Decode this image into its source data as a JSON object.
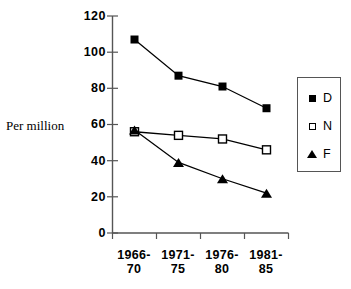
{
  "chart_data": {
    "type": "line",
    "title": "",
    "xlabel": "",
    "ylabel": "Per million",
    "ylim": [
      0,
      120
    ],
    "ytick_values": [
      0,
      20,
      40,
      60,
      80,
      100,
      120
    ],
    "ytick_labels": [
      "0",
      "20",
      "40",
      "60",
      "80",
      "100",
      "120"
    ],
    "grid": false,
    "legend_position": "right",
    "categories": [
      "1966-\n70",
      "1971-\n75",
      "1976-\n80",
      "1981-\n85"
    ],
    "category_labels_flat": [
      "1966-70",
      "1971-75",
      "1976-80",
      "1981-85"
    ],
    "series": [
      {
        "name": "D",
        "marker": "filled-square",
        "values": [
          107,
          87,
          81,
          69
        ]
      },
      {
        "name": "N",
        "marker": "open-square",
        "values": [
          56,
          54,
          52,
          46
        ]
      },
      {
        "name": "F",
        "marker": "filled-triangle",
        "values": [
          57,
          39,
          30,
          22
        ]
      }
    ]
  },
  "axis": {
    "y_title": "Per million",
    "y_ticks": [
      "120",
      "100",
      "80",
      "60",
      "40",
      "20",
      "0"
    ],
    "x_ticks": [
      "1966-\n70",
      "1971-\n75",
      "1976-\n80",
      "1981-\n85"
    ]
  },
  "legend": {
    "entries": [
      {
        "marker_icon": "filled-square-icon",
        "label": "D"
      },
      {
        "marker_icon": "open-square-icon",
        "label": "N"
      },
      {
        "marker_icon": "filled-triangle-icon",
        "label": "F"
      }
    ]
  },
  "colors": {
    "series_line": "#000000",
    "axis": "#555555",
    "background": "#ffffff",
    "legend_border": "#555555"
  }
}
